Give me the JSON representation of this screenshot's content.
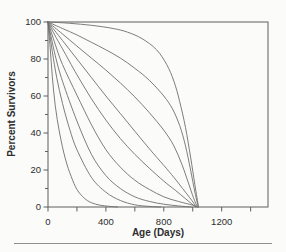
{
  "figure": {
    "type_label": "survivorship-curves-figure"
  },
  "colors": {
    "background": "#fbfbf9",
    "curve": "#6e6e6e",
    "axis": "#5f5f5f",
    "text": "#2e2e2e",
    "divider": "#8f8f8f"
  },
  "chart_data": {
    "type": "line",
    "title": "",
    "xlabel": "Age (Days)",
    "ylabel": "Percent Survivors",
    "xlim": [
      0,
      1520
    ],
    "ylim": [
      0,
      100
    ],
    "x_major_ticks": [
      0,
      400,
      800,
      1200
    ],
    "x_minor_ticks": [
      200,
      600,
      1000,
      1400
    ],
    "y_major_ticks": [
      0,
      20,
      40,
      60,
      80,
      100
    ],
    "y_minor_ticks": [
      10,
      30,
      50,
      70,
      90
    ],
    "grid": false,
    "legend": false,
    "plot_border": true,
    "series": [
      {
        "name": "curve-1-type-I-rectangular",
        "points": [
          [
            0,
            100
          ],
          [
            150,
            99.3
          ],
          [
            300,
            98.2
          ],
          [
            450,
            96.5
          ],
          [
            550,
            94.5
          ],
          [
            650,
            91
          ],
          [
            750,
            85
          ],
          [
            820,
            77
          ],
          [
            870,
            68
          ],
          [
            910,
            57
          ],
          [
            950,
            43
          ],
          [
            985,
            27
          ],
          [
            1015,
            12
          ],
          [
            1040,
            0
          ]
        ]
      },
      {
        "name": "curve-2",
        "points": [
          [
            0,
            100
          ],
          [
            100,
            96.5
          ],
          [
            200,
            93
          ],
          [
            300,
            89
          ],
          [
            400,
            85
          ],
          [
            500,
            80.5
          ],
          [
            600,
            75
          ],
          [
            700,
            68.5
          ],
          [
            800,
            60
          ],
          [
            860,
            53
          ],
          [
            910,
            44
          ],
          [
            950,
            33
          ],
          [
            985,
            20
          ],
          [
            1015,
            8
          ],
          [
            1038,
            0
          ]
        ]
      },
      {
        "name": "curve-3",
        "points": [
          [
            0,
            100
          ],
          [
            100,
            93.5
          ],
          [
            200,
            87
          ],
          [
            300,
            80.5
          ],
          [
            400,
            74
          ],
          [
            500,
            67
          ],
          [
            600,
            59.5
          ],
          [
            700,
            51
          ],
          [
            800,
            41.5
          ],
          [
            870,
            33
          ],
          [
            925,
            23
          ],
          [
            970,
            13
          ],
          [
            1005,
            5
          ],
          [
            1032,
            0
          ]
        ]
      },
      {
        "name": "curve-4-linear",
        "points": [
          [
            0,
            100
          ],
          [
            100,
            90
          ],
          [
            200,
            80
          ],
          [
            300,
            70
          ],
          [
            400,
            60
          ],
          [
            500,
            50.5
          ],
          [
            600,
            41
          ],
          [
            700,
            31.5
          ],
          [
            800,
            22.5
          ],
          [
            870,
            16
          ],
          [
            930,
            10
          ],
          [
            980,
            5
          ],
          [
            1026,
            0
          ]
        ]
      },
      {
        "name": "curve-5",
        "points": [
          [
            0,
            100
          ],
          [
            50,
            92.5
          ],
          [
            100,
            85.5
          ],
          [
            200,
            71.5
          ],
          [
            300,
            58.5
          ],
          [
            400,
            47
          ],
          [
            500,
            37
          ],
          [
            600,
            28.5
          ],
          [
            700,
            21
          ],
          [
            800,
            14
          ],
          [
            880,
            9
          ],
          [
            950,
            4.5
          ],
          [
            1020,
            0
          ]
        ]
      },
      {
        "name": "curve-6",
        "points": [
          [
            0,
            100
          ],
          [
            50,
            88
          ],
          [
            100,
            77
          ],
          [
            200,
            60.5
          ],
          [
            300,
            44.5
          ],
          [
            400,
            31
          ],
          [
            500,
            21.5
          ],
          [
            600,
            14.5
          ],
          [
            700,
            9.5
          ],
          [
            800,
            5.5
          ],
          [
            900,
            3
          ],
          [
            1000,
            1
          ],
          [
            1030,
            0
          ]
        ]
      },
      {
        "name": "curve-7",
        "points": [
          [
            0,
            100
          ],
          [
            50,
            82
          ],
          [
            100,
            68
          ],
          [
            200,
            46.5
          ],
          [
            300,
            28.5
          ],
          [
            400,
            17
          ],
          [
            500,
            10
          ],
          [
            600,
            5.5
          ],
          [
            700,
            3
          ],
          [
            800,
            1.5
          ],
          [
            900,
            0.6
          ],
          [
            990,
            0
          ]
        ]
      },
      {
        "name": "curve-8",
        "points": [
          [
            0,
            100
          ],
          [
            30,
            84
          ],
          [
            60,
            70
          ],
          [
            100,
            56
          ],
          [
            150,
            42
          ],
          [
            200,
            31
          ],
          [
            300,
            16
          ],
          [
            400,
            8
          ],
          [
            500,
            3.5
          ],
          [
            600,
            1.2
          ],
          [
            700,
            0.3
          ],
          [
            780,
            0
          ]
        ]
      },
      {
        "name": "curve-9-type-III-steep",
        "points": [
          [
            0,
            100
          ],
          [
            15,
            86
          ],
          [
            30,
            70.5
          ],
          [
            50,
            55
          ],
          [
            80,
            40
          ],
          [
            120,
            26
          ],
          [
            160,
            16.5
          ],
          [
            200,
            9.5
          ],
          [
            250,
            4.8
          ],
          [
            300,
            2.3
          ],
          [
            360,
            1
          ],
          [
            420,
            0.4
          ],
          [
            480,
            0
          ]
        ]
      }
    ]
  }
}
